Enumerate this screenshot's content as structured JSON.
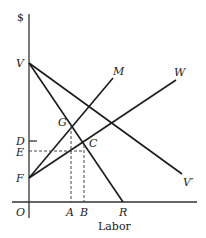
{
  "diagram": {
    "y_axis_label": "$",
    "x_axis_label": "Labor",
    "origin_label": "O",
    "points": {
      "V": "V",
      "F": "F",
      "D": "D",
      "E": "E",
      "G": "G",
      "C": "C",
      "A": "A",
      "B": "B",
      "R": "R"
    },
    "lines": {
      "M": "M",
      "W": "W",
      "V_prime": "V′"
    }
  }
}
